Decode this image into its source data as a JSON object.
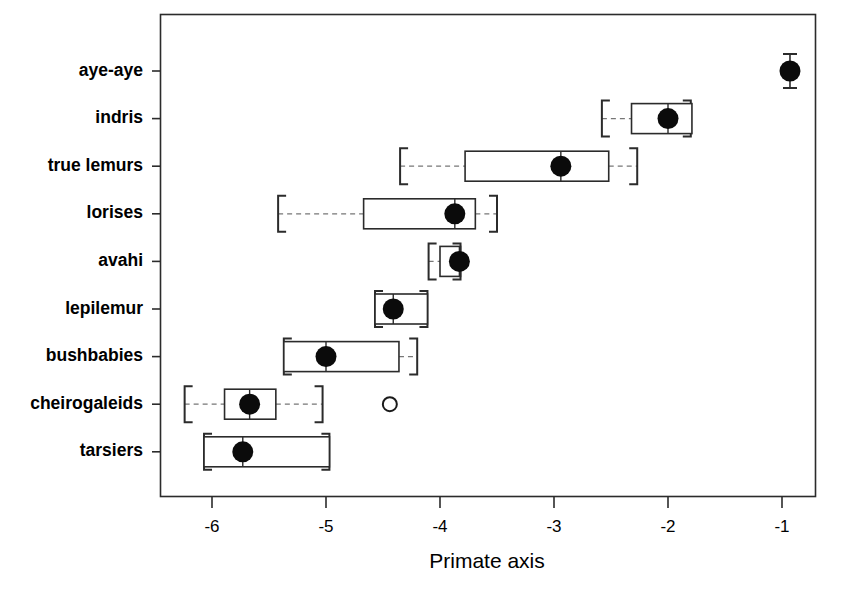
{
  "chart_data": {
    "type": "box",
    "title": "",
    "xlabel": "Primate axis",
    "ylabel": "",
    "xlim": [
      -6.42,
      -0.7
    ],
    "ylim": [
      0.5,
      9.5
    ],
    "grid": false,
    "legend": null,
    "xticks": [
      "-6",
      "-5",
      "-4",
      "-3",
      "-2",
      "-1"
    ],
    "xtick_values": [
      -6,
      -5,
      -4,
      -3,
      -2,
      -1
    ],
    "categories": [
      "aye-aye",
      "indris",
      "true lemurs",
      "lorises",
      "avahi",
      "lepilemur",
      "bushbabies",
      "cheirogaleids",
      "tarsiers"
    ],
    "orientation": "horizontal",
    "boxes": [
      {
        "label": "aye-aye",
        "median": -0.93,
        "q1": null,
        "q3": null,
        "whisker_low": null,
        "whisker_high": null,
        "vertical_cap": true,
        "outliers": []
      },
      {
        "label": "indris",
        "median": -2.0,
        "q1": -2.32,
        "q3": -1.79,
        "whisker_low": -2.58,
        "whisker_high": -1.8,
        "vertical_cap": false,
        "outliers": []
      },
      {
        "label": "true lemurs",
        "median": -2.94,
        "q1": -3.78,
        "q3": -2.52,
        "whisker_low": -4.35,
        "whisker_high": -2.27,
        "vertical_cap": false,
        "outliers": []
      },
      {
        "label": "lorises",
        "median": -3.87,
        "q1": -4.67,
        "q3": -3.69,
        "whisker_low": -5.42,
        "whisker_high": -3.5,
        "vertical_cap": false,
        "outliers": []
      },
      {
        "label": "avahi",
        "median": -3.83,
        "q1": -4.0,
        "q3": -3.82,
        "whisker_low": -4.1,
        "whisker_high": -3.82,
        "vertical_cap": false,
        "outliers": []
      },
      {
        "label": "lepilemur",
        "median": -4.41,
        "q1": -4.57,
        "q3": -4.11,
        "whisker_low": -4.57,
        "whisker_high": -4.11,
        "vertical_cap": false,
        "outliers": []
      },
      {
        "label": "bushbabies",
        "median": -5.0,
        "q1": -5.37,
        "q3": -4.36,
        "whisker_low": -5.37,
        "whisker_high": -4.2,
        "vertical_cap": false,
        "outliers": []
      },
      {
        "label": "cheirogaleids",
        "median": -5.67,
        "q1": -5.89,
        "q3": -5.44,
        "whisker_low": -6.24,
        "whisker_high": -5.03,
        "vertical_cap": false,
        "outliers": [
          -4.44
        ]
      },
      {
        "label": "tarsiers",
        "median": -5.73,
        "q1": -6.07,
        "q3": -4.97,
        "whisker_low": -6.07,
        "whisker_high": -4.97,
        "vertical_cap": false,
        "outliers": []
      }
    ]
  },
  "axis": {
    "x_title": "Primate axis"
  },
  "caption": {
    "text": ""
  }
}
